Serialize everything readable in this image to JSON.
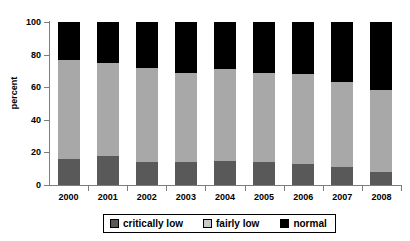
{
  "chart_data": {
    "type": "bar",
    "subtype": "stacked-column-100",
    "title": "",
    "xlabel": "",
    "ylabel": "percent",
    "ylim": [
      0,
      100
    ],
    "yticks": [
      0,
      20,
      40,
      60,
      80,
      100
    ],
    "grid": false,
    "legend_position": "bottom",
    "categories": [
      "2000",
      "2001",
      "2002",
      "2003",
      "2004",
      "2005",
      "2006",
      "2007",
      "2008"
    ],
    "series": [
      {
        "name": "critically low",
        "color": "#595959",
        "values": [
          16,
          18,
          14,
          14,
          15,
          14,
          13,
          11,
          8
        ]
      },
      {
        "name": "fairly low",
        "color": "#a8a8a8",
        "values": [
          61,
          57,
          58,
          55,
          56,
          55,
          55,
          52,
          50
        ]
      },
      {
        "name": "normal",
        "color": "#000000",
        "values": [
          23,
          25,
          28,
          31,
          29,
          31,
          32,
          37,
          42
        ]
      }
    ]
  },
  "axes": {
    "y_title": "percent",
    "y_tick_labels": [
      "0",
      "20",
      "40",
      "60",
      "80",
      "100"
    ],
    "x_tick_labels": [
      "2000",
      "2001",
      "2002",
      "2003",
      "2004",
      "2005",
      "2006",
      "2007",
      "2008"
    ]
  },
  "legend": {
    "entries": [
      {
        "label": "critically low",
        "swatch": "dark-gray"
      },
      {
        "label": "fairly low",
        "swatch": "light-gray"
      },
      {
        "label": "normal",
        "swatch": "black"
      }
    ]
  }
}
